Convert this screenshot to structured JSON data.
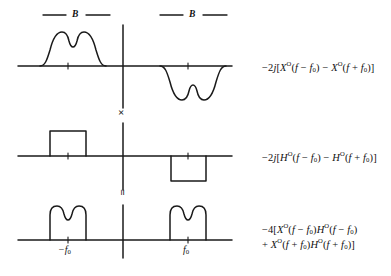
{
  "figure": {
    "type": "signal-spectrum-diagram",
    "background_color": "#ffffff",
    "stroke_color": "#1a1a1a"
  },
  "bandwidth_markers": [
    {
      "label": "B",
      "side": "left"
    },
    {
      "label": "B",
      "side": "right"
    }
  ],
  "operators": {
    "multiply": "×",
    "equals": "="
  },
  "rows": [
    {
      "id": "row-signal",
      "formula_lines": [
        {
          "segments": [
            {
              "t": "−2",
              "style": "plain"
            },
            {
              "t": "j",
              "style": "italic"
            },
            {
              "t": "[",
              "style": "plain"
            },
            {
              "t": "X",
              "style": "italic"
            },
            {
              "t": "O",
              "style": "sup"
            },
            {
              "t": "(",
              "style": "plain"
            },
            {
              "t": "f",
              "style": "italic"
            },
            {
              "t": " − ",
              "style": "plain"
            },
            {
              "t": "f",
              "style": "italic"
            },
            {
              "t": "0",
              "style": "sub"
            },
            {
              "t": ") − ",
              "style": "plain"
            },
            {
              "t": "X",
              "style": "italic"
            },
            {
              "t": "O",
              "style": "sup"
            },
            {
              "t": "(",
              "style": "plain"
            },
            {
              "t": "f",
              "style": "italic"
            },
            {
              "t": " + ",
              "style": "plain"
            },
            {
              "t": "f",
              "style": "italic"
            },
            {
              "t": "0",
              "style": "sub"
            },
            {
              "t": ")]",
              "style": "plain"
            }
          ]
        }
      ]
    },
    {
      "id": "row-filter",
      "formula_lines": [
        {
          "segments": [
            {
              "t": "−2",
              "style": "plain"
            },
            {
              "t": "j",
              "style": "italic"
            },
            {
              "t": "[",
              "style": "plain"
            },
            {
              "t": "H",
              "style": "italic"
            },
            {
              "t": "O",
              "style": "sup"
            },
            {
              "t": "(",
              "style": "plain"
            },
            {
              "t": "f",
              "style": "italic"
            },
            {
              "t": " − ",
              "style": "plain"
            },
            {
              "t": "f",
              "style": "italic"
            },
            {
              "t": "0",
              "style": "sub"
            },
            {
              "t": ") − ",
              "style": "plain"
            },
            {
              "t": "H",
              "style": "italic"
            },
            {
              "t": "O",
              "style": "sup"
            },
            {
              "t": "(",
              "style": "plain"
            },
            {
              "t": "f",
              "style": "italic"
            },
            {
              "t": " + ",
              "style": "plain"
            },
            {
              "t": "f",
              "style": "italic"
            },
            {
              "t": "0",
              "style": "sub"
            },
            {
              "t": ")]",
              "style": "plain"
            }
          ]
        }
      ]
    },
    {
      "id": "row-product",
      "formula_lines": [
        {
          "segments": [
            {
              "t": "−4[",
              "style": "plain"
            },
            {
              "t": "X",
              "style": "italic"
            },
            {
              "t": "O",
              "style": "sup"
            },
            {
              "t": "(",
              "style": "plain"
            },
            {
              "t": "f",
              "style": "italic"
            },
            {
              "t": " − ",
              "style": "plain"
            },
            {
              "t": "f",
              "style": "italic"
            },
            {
              "t": "0",
              "style": "sub"
            },
            {
              "t": ")",
              "style": "plain"
            },
            {
              "t": "H",
              "style": "italic"
            },
            {
              "t": "O",
              "style": "sup"
            },
            {
              "t": "(",
              "style": "plain"
            },
            {
              "t": "f",
              "style": "italic"
            },
            {
              "t": " − ",
              "style": "plain"
            },
            {
              "t": "f",
              "style": "italic"
            },
            {
              "t": "0",
              "style": "sub"
            },
            {
              "t": ")",
              "style": "plain"
            }
          ]
        },
        {
          "segments": [
            {
              "t": "+ ",
              "style": "plain"
            },
            {
              "t": "X",
              "style": "italic"
            },
            {
              "t": "O",
              "style": "sup"
            },
            {
              "t": "(",
              "style": "plain"
            },
            {
              "t": "f",
              "style": "italic"
            },
            {
              "t": " + ",
              "style": "plain"
            },
            {
              "t": "f",
              "style": "italic"
            },
            {
              "t": "0",
              "style": "sub"
            },
            {
              "t": ")",
              "style": "plain"
            },
            {
              "t": "H",
              "style": "italic"
            },
            {
              "t": "O",
              "style": "sup"
            },
            {
              "t": "(",
              "style": "plain"
            },
            {
              "t": "f",
              "style": "italic"
            },
            {
              "t": " + ",
              "style": "plain"
            },
            {
              "t": "f",
              "style": "italic"
            },
            {
              "t": "0",
              "style": "sub"
            },
            {
              "t": ")]",
              "style": "plain"
            }
          ]
        }
      ]
    }
  ],
  "axis_labels": [
    {
      "id": "neg-f0",
      "text": "−f",
      "sub": "0"
    },
    {
      "id": "pos-f0",
      "text": "f",
      "sub": "0"
    }
  ],
  "chart_data": {
    "type": "line",
    "title": "",
    "xlabel": "",
    "ylabel": "",
    "rows": [
      {
        "name": "-2j[X^O(f-f0) - X^O(f+f0)]",
        "lobes": [
          {
            "center": -1,
            "sign": "positive",
            "shape": "dual-hump",
            "amplitude": 1
          },
          {
            "center": 1,
            "sign": "negative",
            "shape": "dual-hump",
            "amplitude": 1
          }
        ]
      },
      {
        "name": "-2j[H^O(f-f0) - H^O(f+f0)]",
        "lobes": [
          {
            "center": -1,
            "sign": "positive",
            "shape": "rectangle",
            "amplitude": 1
          },
          {
            "center": 1,
            "sign": "negative",
            "shape": "rectangle",
            "amplitude": 1
          }
        ]
      },
      {
        "name": "-4[X^O(f-f0)H^O(f-f0) + X^O(f+f0)H^O(f+f0)]",
        "lobes": [
          {
            "center": -1,
            "sign": "positive",
            "shape": "gated-dual-hump",
            "amplitude": 1
          },
          {
            "center": 1,
            "sign": "positive",
            "shape": "gated-dual-hump",
            "amplitude": 1
          }
        ]
      }
    ],
    "x_ticks": [
      {
        "value": -1,
        "label": "-f0"
      },
      {
        "value": 0,
        "label": ""
      },
      {
        "value": 1,
        "label": "f0"
      }
    ],
    "grid": false,
    "legend": "none"
  }
}
